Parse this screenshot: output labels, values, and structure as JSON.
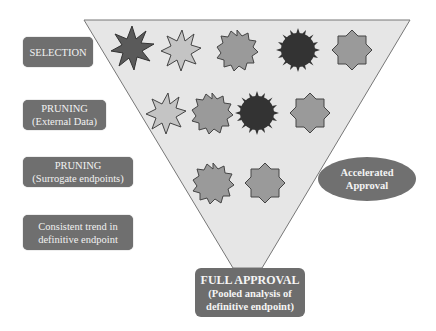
{
  "diagram": {
    "stages": [
      {
        "line1": "SELECTION",
        "line2": ""
      },
      {
        "line1": "PRUNING",
        "line2": "(External Data)"
      },
      {
        "line1": "PRUNING",
        "line2": "(Surrogate endpoints)"
      },
      {
        "line1": "Consistent trend in",
        "line2": "definitive endpoint"
      }
    ],
    "accelerated": {
      "line1": "Accelerated",
      "line2": "Approval"
    },
    "final": {
      "line1": "FULL APPROVAL",
      "line2": "(Pooled analysis of",
      "line3": "definitive endpoint)"
    },
    "colors": {
      "funnel_fill": "#e6e6e6",
      "funnel_stroke": "#777777",
      "box_fill": "#6f6f6f",
      "box_text": "#f2f2f2",
      "shape_dark": "#3d3d3d",
      "shape_mid": "#8c8c8c",
      "shape_light": "#bdbdbd"
    },
    "candidate_rows": [
      [
        "spiky-dark",
        "spiky-light",
        "star12-mid",
        "sunburst-dark",
        "star8-mid"
      ],
      [
        "spiky-light",
        "star12-mid",
        "sunburst-dark",
        "star8-mid"
      ],
      [
        "star12-mid",
        "star8-mid"
      ]
    ]
  }
}
